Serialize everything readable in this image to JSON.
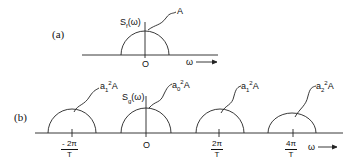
{
  "panel_a": {
    "label": "(a)",
    "function_label": "S_f(ω)",
    "peak_label": "A",
    "origin_label": "O",
    "axis_label": "ω →"
  },
  "panel_b": {
    "label": "(b)",
    "function_label": "S_g(ω)",
    "axis_label": "ω →",
    "bumps": [
      {
        "peak_label": "a1²A",
        "tick_num": "- 2π",
        "tick_den": "T"
      },
      {
        "peak_label": "a0²A",
        "tick_label": "O"
      },
      {
        "peak_label": "a1²A",
        "tick_num": "2π",
        "tick_den": "T"
      },
      {
        "peak_label": "a2²A",
        "tick_num": "4π",
        "tick_den": "T"
      }
    ]
  }
}
